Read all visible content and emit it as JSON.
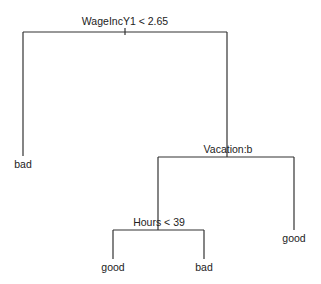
{
  "diagram": {
    "type": "decision-tree",
    "line_color": "#333333",
    "text_color": "#222222",
    "nodes": {
      "root": {
        "label": "WageIncY1 < 2.65"
      },
      "left_leaf": {
        "label": "bad"
      },
      "vacation": {
        "label": "Vacation:b"
      },
      "hours": {
        "label": "Hours < 39"
      },
      "hours_left_leaf": {
        "label": "good"
      },
      "hours_right_leaf": {
        "label": "bad"
      },
      "vacation_right_leaf": {
        "label": "good"
      }
    }
  }
}
